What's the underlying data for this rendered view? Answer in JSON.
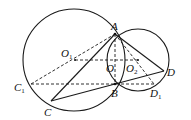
{
  "diagram": {
    "type": "geometry",
    "points": {
      "A": {
        "label": "A"
      },
      "B": {
        "label": "B"
      },
      "C": {
        "label": "C"
      },
      "C1": {
        "label": "C",
        "sub": "1"
      },
      "D": {
        "label": "D"
      },
      "D1": {
        "label": "D",
        "sub": "1"
      },
      "O": {
        "label": "O"
      },
      "O1": {
        "label": "O",
        "sub": "1"
      },
      "O2": {
        "label": "O",
        "sub": "2"
      }
    },
    "solid_segments": [
      "AC",
      "CB",
      "BD",
      "AD",
      "AB-arc-left",
      "AB-arc-right"
    ],
    "dashed_segments": [
      "AB",
      "O1O2",
      "C1D1",
      "C1A",
      "AD1"
    ],
    "circles": [
      "circle-O1",
      "circle-O2"
    ]
  }
}
